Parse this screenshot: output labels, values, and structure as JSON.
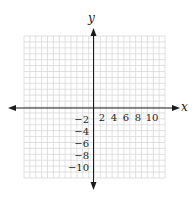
{
  "diagram": {
    "type": "coordinate-plane",
    "x_axis_label": "x",
    "y_axis_label": "y",
    "x_range": [
      -12,
      12
    ],
    "y_range": [
      -12,
      12
    ],
    "grid_step": 1,
    "x_tick_labels": [
      "2",
      "4",
      "6",
      "8",
      "10"
    ],
    "y_tick_labels": [
      "−2",
      "−4",
      "−6",
      "−8",
      "−10"
    ],
    "colors": {
      "grid": "#d4d4d4",
      "axis": "#1a1a1a",
      "text": "#1a1a1a"
    }
  }
}
